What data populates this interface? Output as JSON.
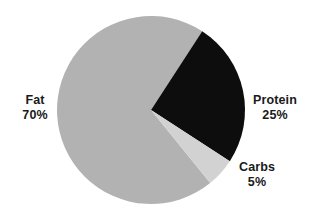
{
  "chart_data": {
    "type": "pie",
    "title": "",
    "subtitle": "",
    "xlabel": "",
    "ylabel": "",
    "grid": false,
    "legend_position": "none",
    "labels_position": "outside",
    "categories": [
      "Fat",
      "Protein",
      "Carbs"
    ],
    "values": [
      70,
      25,
      5
    ],
    "units": "%",
    "slices": [
      {
        "name": "Fat",
        "value": 70,
        "value_label": "70%",
        "color": "#b2b2b2",
        "start_angle_deg": 33,
        "end_angle_deg": 303
      },
      {
        "name": "Protein",
        "value": 25,
        "value_label": "25%",
        "color": "#0d0d0d",
        "start_angle_deg": 303,
        "end_angle_deg": 33
      },
      {
        "name": "Carbs",
        "value": 5,
        "value_label": "5%",
        "color": "#d2d2d2",
        "start_angle_deg": 15,
        "end_angle_deg": 33
      }
    ],
    "annotations": []
  },
  "chart": {
    "background_color": "#ffffff",
    "center_x": 151,
    "center_y": 110,
    "radius": 94,
    "labels": {
      "fat": {
        "name": "Fat",
        "value_label": "70%"
      },
      "protein": {
        "name": "Protein",
        "value_label": "25%"
      },
      "carbs": {
        "name": "Carbs",
        "value_label": "5%"
      }
    }
  }
}
